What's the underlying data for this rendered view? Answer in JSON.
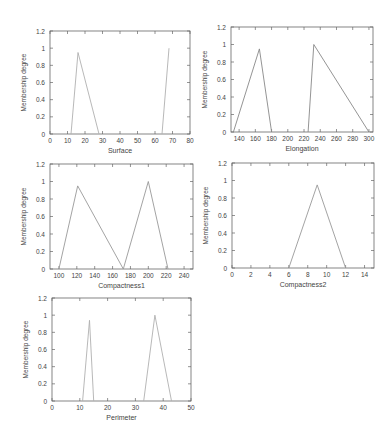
{
  "chart_data": [
    {
      "type": "line",
      "title": "",
      "xlabel": "Surface",
      "ylabel": "Membership degree",
      "xlim": [
        0,
        80
      ],
      "ylim": [
        0,
        1.2
      ],
      "xticks": [
        0,
        10,
        20,
        30,
        40,
        50,
        60,
        70,
        80
      ],
      "yticks": [
        0,
        0.2,
        0.4,
        0.6,
        0.8,
        1,
        1.2
      ],
      "grid": false,
      "legend": null,
      "series": [
        {
          "name": "set1",
          "x": [
            12,
            16,
            28
          ],
          "y": [
            0,
            0.95,
            0
          ]
        },
        {
          "name": "set2",
          "x": [
            64,
            68
          ],
          "y": [
            0,
            1
          ]
        }
      ]
    },
    {
      "type": "line",
      "title": "",
      "xlabel": "Elongation",
      "ylabel": "Membership degree",
      "xlim": [
        130,
        305
      ],
      "ylim": [
        0,
        1.2
      ],
      "xticks": [
        140,
        160,
        180,
        200,
        220,
        240,
        260,
        280,
        300
      ],
      "yticks": [
        0,
        0.2,
        0.4,
        0.6,
        0.8,
        1,
        1.2
      ],
      "grid": false,
      "legend": null,
      "series": [
        {
          "name": "set1",
          "x": [
            133,
            165,
            180
          ],
          "y": [
            0,
            0.95,
            0
          ]
        },
        {
          "name": "set2",
          "x": [
            225,
            232,
            300
          ],
          "y": [
            0,
            1,
            0
          ]
        }
      ]
    },
    {
      "type": "line",
      "title": "",
      "xlabel": "Compactness1",
      "ylabel": "Membership degree",
      "xlim": [
        90,
        250
      ],
      "ylim": [
        0,
        1.2
      ],
      "xticks": [
        100,
        120,
        140,
        160,
        180,
        200,
        220,
        240
      ],
      "yticks": [
        0,
        0.2,
        0.4,
        0.6,
        0.8,
        1,
        1.2
      ],
      "grid": false,
      "legend": null,
      "series": [
        {
          "name": "set1",
          "x": [
            100,
            121,
            172
          ],
          "y": [
            0,
            0.95,
            0
          ]
        },
        {
          "name": "set2",
          "x": [
            172,
            200,
            222
          ],
          "y": [
            0,
            1,
            0
          ]
        }
      ]
    },
    {
      "type": "line",
      "title": "",
      "xlabel": "Compactness2",
      "ylabel": "Membership degree",
      "xlim": [
        0,
        15
      ],
      "ylim": [
        0,
        1.2
      ],
      "xticks": [
        0,
        2,
        4,
        6,
        8,
        10,
        12,
        14
      ],
      "yticks": [
        0,
        0.2,
        0.4,
        0.6,
        0.8,
        1,
        1.2
      ],
      "grid": false,
      "legend": null,
      "series": [
        {
          "name": "set1",
          "x": [
            6,
            9,
            12
          ],
          "y": [
            0,
            0.95,
            0
          ]
        }
      ]
    },
    {
      "type": "line",
      "title": "",
      "xlabel": "Perimeter",
      "ylabel": "Membership degree",
      "xlim": [
        0,
        50
      ],
      "ylim": [
        0,
        1.2
      ],
      "xticks": [
        0,
        10,
        20,
        30,
        40,
        50
      ],
      "yticks": [
        0,
        0.2,
        0.4,
        0.6,
        0.8,
        1,
        1.2
      ],
      "grid": false,
      "legend": null,
      "series": [
        {
          "name": "set1",
          "x": [
            11,
            13.5,
            15
          ],
          "y": [
            0,
            0.94,
            0
          ]
        },
        {
          "name": "set2",
          "x": [
            33,
            37,
            43
          ],
          "y": [
            0,
            1,
            0
          ]
        }
      ]
    }
  ],
  "panels": [
    {
      "x0": 50,
      "x1": 190,
      "y0": 31,
      "y1": 134,
      "line_color": "#b0b0b0"
    },
    {
      "x0": 231,
      "x1": 373,
      "y0": 27,
      "y1": 132,
      "line_color": "#888888"
    },
    {
      "x0": 50,
      "x1": 193,
      "y0": 164,
      "y1": 269,
      "line_color": "#999999"
    },
    {
      "x0": 232,
      "x1": 374,
      "y0": 163,
      "y1": 268,
      "line_color": "#999999"
    },
    {
      "x0": 52,
      "x1": 191,
      "y0": 298,
      "y1": 401,
      "line_color": "#b0b0b0"
    }
  ],
  "colors": {
    "axis": "#666666",
    "text": "#444444"
  }
}
